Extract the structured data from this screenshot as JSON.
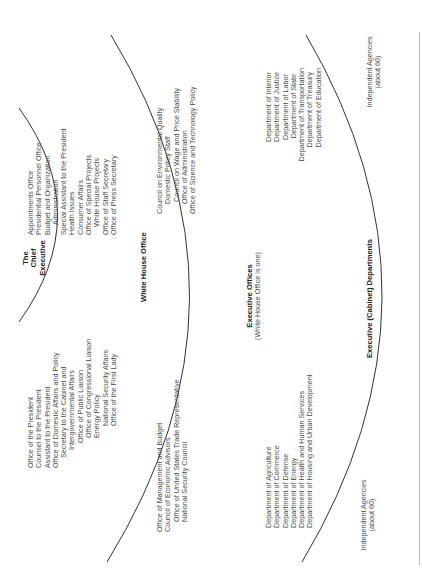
{
  "diagram": {
    "orientation": "rotated 90 degrees counter-clockwise",
    "rings": [
      {
        "name": "The Chief Executive",
        "label_lines": [
          "The",
          "Chief",
          "Executive"
        ]
      },
      {
        "name": "White House Office",
        "label": "White House Office",
        "left_items": [
          "Office of the President",
          "Counsel to the President",
          "Assistant to the President",
          "Office of Domestic Affairs and Policy",
          "Secretary to the Cabinet and",
          "Intergovernmental Affairs",
          "Office of Public Liaison",
          "Office of Congressional Liaison",
          "Energy Policy",
          "National Security Affairs",
          "Office of the First Lady"
        ],
        "right_items": [
          "Appointments Office",
          "Presidential Personnel Office",
          "Budget and Organization",
          "Administration",
          "Special Assistant to the President",
          "Health Issues",
          "Consumer Affairs",
          "Office of Special Projects",
          "White House Projects",
          "Office of Staff Secretary",
          "Office of Press Secretary"
        ]
      },
      {
        "name": "Executive Offices",
        "label": "Executive Offices",
        "sublabel": "(White House Office is one)",
        "left_items": [
          "Office of Management and Budget",
          "Council of Economic Advisors",
          "Office of United States Trade Representative",
          "National Security Council"
        ],
        "right_items": [
          "Council on Environmental Quality",
          "Domestic Policy Staff",
          "Council on Wage and Price Stability",
          "Office of Administration",
          "Office of Science and Technology Policy"
        ]
      },
      {
        "name": "Executive (Cabinet) Departments",
        "label": "Executive (Cabinet) Departments",
        "left_items": [
          "Department of Agriculture",
          "Department of Commerce",
          "Department of Defense",
          "Department of Energy",
          "Department of Health and Human Services",
          "Department of Housing and Urban Development"
        ],
        "right_items": [
          "Department of Interior",
          "Department of Justice",
          "Department of Labor",
          "Department of State",
          "Department of Transportation",
          "Department of Treasury",
          "Department of Education"
        ]
      },
      {
        "name": "Independent Agencies",
        "left_label": [
          "Independent Agencies",
          "(about 60)"
        ],
        "right_label": [
          "Independent Agencies",
          "(about 60)"
        ]
      }
    ],
    "colors": {
      "line": "#333333",
      "text": "#4a4a4a",
      "edge": "#b8b8b8"
    }
  }
}
